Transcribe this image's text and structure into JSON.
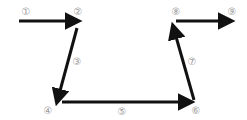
{
  "diagram": {
    "type": "path-flow",
    "arrow_color": "#111111",
    "label_color": "#9a9a9a",
    "labels": [
      {
        "id": 1,
        "text": "①",
        "x": 26,
        "y": 12
      },
      {
        "id": 2,
        "text": "②",
        "x": 78,
        "y": 12
      },
      {
        "id": 3,
        "text": "③",
        "x": 77,
        "y": 62
      },
      {
        "id": 4,
        "text": "④",
        "x": 48,
        "y": 111
      },
      {
        "id": 5,
        "text": "⑤",
        "x": 122,
        "y": 112
      },
      {
        "id": 6,
        "text": "⑥",
        "x": 196,
        "y": 111
      },
      {
        "id": 7,
        "text": "⑦",
        "x": 192,
        "y": 62
      },
      {
        "id": 8,
        "text": "⑧",
        "x": 176,
        "y": 12
      },
      {
        "id": 9,
        "text": "⑨",
        "x": 232,
        "y": 12
      }
    ],
    "arrows": [
      {
        "from": "①",
        "to": "②",
        "x1": 19,
        "y1": 21,
        "x2": 78,
        "y2": 21
      },
      {
        "from": "②",
        "to": "④",
        "x1": 77,
        "y1": 28,
        "x2": 57,
        "y2": 102
      },
      {
        "from": "④",
        "to": "⑥",
        "x1": 62,
        "y1": 102,
        "x2": 191,
        "y2": 102
      },
      {
        "from": "⑥",
        "to": "⑧",
        "x1": 194,
        "y1": 100,
        "x2": 173,
        "y2": 26
      },
      {
        "from": "⑧",
        "to": "⑨",
        "x1": 176,
        "y1": 21,
        "x2": 231,
        "y2": 21
      }
    ]
  }
}
